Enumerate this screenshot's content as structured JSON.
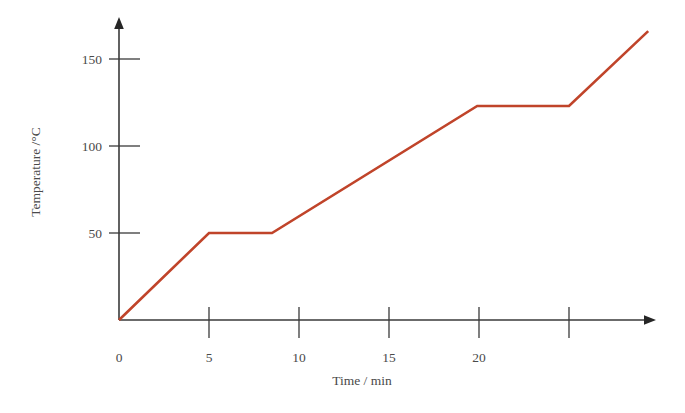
{
  "chart_data": {
    "type": "line",
    "title": "",
    "subtitle": "",
    "xlabel": "Time / min",
    "ylabel": "Temperature /°C",
    "xlim": [
      0,
      29.8
    ],
    "ylim": [
      0,
      173
    ],
    "grid": false,
    "legend": null,
    "xticks": [
      0,
      5,
      10,
      15,
      20,
      25
    ],
    "xtick_labels": [
      "0",
      "5",
      "10",
      "15",
      "20",
      ""
    ],
    "yticks": [
      50,
      100,
      150
    ],
    "ytick_labels": [
      "50",
      "100",
      "150"
    ],
    "series": [
      {
        "name": "heating curve",
        "color": "#c0442a",
        "x": [
          0,
          5.0,
          8.5,
          19.9,
          25.0,
          29.4
        ],
        "y": [
          0,
          50,
          50,
          123,
          123,
          166
        ],
        "points": [
          {
            "t": 0,
            "T": 0,
            "note": "start of heating"
          },
          {
            "t": 5.0,
            "T": 50,
            "note": "first plateau begins"
          },
          {
            "t": 8.5,
            "T": 50,
            "note": "first plateau ends"
          },
          {
            "t": 19.9,
            "T": 123,
            "note": "second plateau begins"
          },
          {
            "t": 25.0,
            "T": 123,
            "note": "second plateau ends"
          },
          {
            "t": 29.4,
            "T": 166,
            "note": "end of trace"
          }
        ]
      }
    ],
    "axis_style": {
      "arrow_ends": true,
      "ticks_cross_axis": true,
      "axis_color": "#3a3a3a",
      "line_color": "#c0442a",
      "background": "#ffffff"
    }
  }
}
